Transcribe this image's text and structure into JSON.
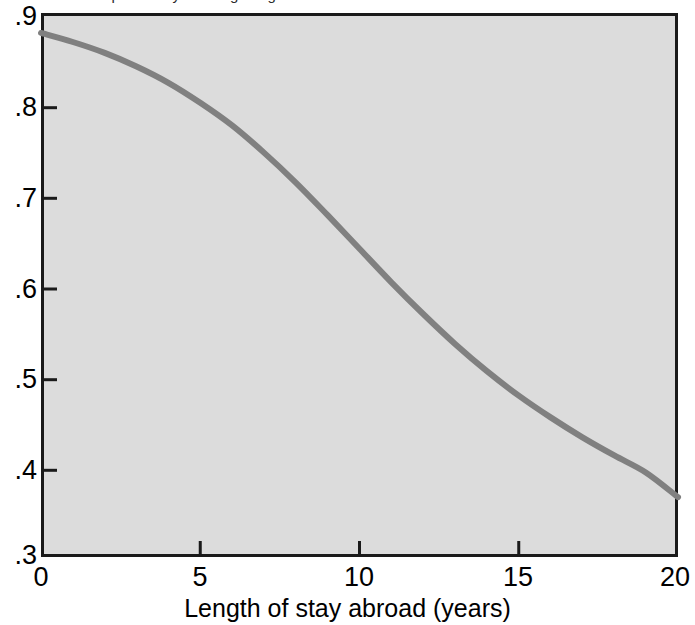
{
  "figure": {
    "top_clipped_caption": "Predicted probability of remigrating",
    "background_color": "#ffffff",
    "plot_area_color": "#dcdcdc",
    "frame_color": "#1a1a1a",
    "curve_color": "#808080"
  },
  "axes": {
    "y_ticks": [
      ".9",
      ".8",
      ".7",
      ".6",
      ".5",
      ".4",
      ".3"
    ],
    "x_ticks": [
      "0",
      "5",
      "10",
      "15",
      "20"
    ],
    "x_title": "Length of stay abroad (years)",
    "y_title": ""
  },
  "chart_data": {
    "type": "line",
    "title": "",
    "subtitle": "",
    "xlabel": "Length of stay abroad (years)",
    "ylabel": "",
    "xlim": [
      0,
      20
    ],
    "ylim": [
      0.3,
      0.9
    ],
    "xticks": [
      0,
      5,
      10,
      15,
      20
    ],
    "yticks": [
      0.3,
      0.4,
      0.5,
      0.6,
      0.7,
      0.8,
      0.9
    ],
    "grid": false,
    "legend": null,
    "series": [
      {
        "name": "Predicted probability",
        "color": "#808080",
        "linewidth": 6,
        "x": [
          0,
          1,
          2,
          3,
          4,
          5,
          6,
          7,
          8,
          9,
          10,
          11,
          12,
          13,
          14,
          15,
          16,
          17,
          18,
          19,
          20
        ],
        "values": [
          0.878,
          0.868,
          0.856,
          0.841,
          0.823,
          0.801,
          0.776,
          0.746,
          0.713,
          0.677,
          0.64,
          0.603,
          0.568,
          0.535,
          0.505,
          0.478,
          0.454,
          0.432,
          0.412,
          0.393,
          0.366
        ]
      }
    ]
  }
}
